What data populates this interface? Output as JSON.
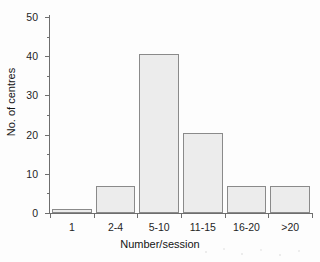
{
  "chart_data": {
    "type": "bar",
    "title": "",
    "xlabel": "Number/session",
    "ylabel": "No. of centres",
    "categories": [
      "1",
      "2-4",
      "5-10",
      "11-15",
      "16-20",
      ">20"
    ],
    "values": [
      1,
      7,
      40.5,
      20.5,
      7,
      7
    ],
    "ylim": [
      0,
      50
    ],
    "y_major_ticks": [
      0,
      10,
      20,
      30,
      40,
      50
    ],
    "y_minor_ticks": [
      5,
      15,
      25,
      35,
      45
    ],
    "y_tick_labels": [
      "0",
      "10",
      "20",
      "30",
      "40",
      "50"
    ],
    "grid": false,
    "legend": false,
    "series": [
      {
        "name": "No. of centres",
        "values": [
          1,
          7,
          40.5,
          20.5,
          7,
          7
        ]
      }
    ],
    "colors": {
      "bar_fill": "#ececec",
      "bar_edge": "#8a8a8a",
      "axis": "#6e6e6e",
      "text": "#1a1a1a",
      "background": "#ffffff"
    }
  }
}
